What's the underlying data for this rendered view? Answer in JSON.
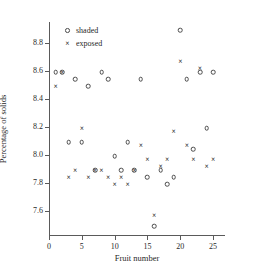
{
  "chart_data": {
    "type": "scatter",
    "title": "",
    "xlabel": "Fruit number",
    "ylabel": "Percentage of solids",
    "xlim": [
      0,
      25.9
    ],
    "ylim": [
      7.42,
      8.95
    ],
    "grid": false,
    "legend_position": "top-left",
    "xticks": [
      "0",
      "5",
      "10",
      "15",
      "20",
      "25"
    ],
    "xtick_values": [
      0,
      5,
      10,
      15,
      20,
      25
    ],
    "yticks": [
      "8.8",
      "8.6",
      "8.4",
      "8.2",
      "8.0",
      "7.8",
      "7.6"
    ],
    "ytick_values": [
      8.8,
      8.6,
      8.4,
      8.2,
      8.0,
      7.8,
      7.6
    ],
    "x": [
      1,
      2,
      3,
      4,
      5,
      6,
      7,
      8,
      9,
      10,
      11,
      12,
      13,
      14,
      15,
      16,
      17,
      18,
      19,
      20,
      21,
      22,
      23,
      24,
      25
    ],
    "series": [
      {
        "name": "shaded",
        "marker": "circle",
        "color": "#4a4a4a",
        "values": [
          8.59,
          8.59,
          8.09,
          8.54,
          8.09,
          8.49,
          7.89,
          8.59,
          8.54,
          7.99,
          7.89,
          8.09,
          7.89,
          8.54,
          7.84,
          7.49,
          7.89,
          7.79,
          7.84,
          8.89,
          8.54,
          8.04,
          8.59,
          8.19,
          8.59
        ]
      },
      {
        "name": "exposed",
        "marker": "cross",
        "color": "#2a2a2a",
        "values": [
          8.49,
          8.59,
          7.84,
          7.89,
          8.19,
          7.84,
          7.89,
          7.89,
          7.84,
          7.79,
          7.84,
          7.79,
          7.89,
          8.07,
          7.97,
          7.57,
          7.92,
          7.97,
          8.17,
          8.67,
          8.07,
          7.97,
          8.62,
          7.92,
          7.97
        ]
      }
    ]
  },
  "legend": {
    "entries": [
      {
        "label": "shaded",
        "marker": "circle-marker-icon"
      },
      {
        "label": "exposed",
        "marker": "cross-marker-icon"
      }
    ]
  }
}
